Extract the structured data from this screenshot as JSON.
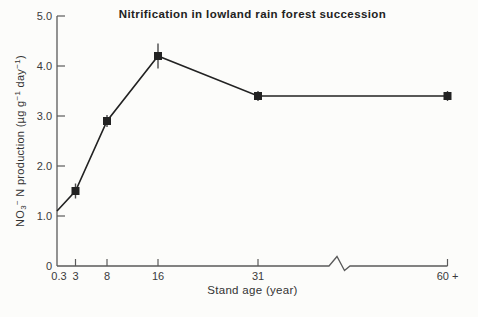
{
  "colors": {
    "background": "#fcfcfa",
    "ink": "#222222",
    "axis": "#5a5a5a",
    "error_bar": "#4a4a4a"
  },
  "chart_data": {
    "type": "line",
    "title": "Nitrification in lowland rain forest succession",
    "xlabel": "Stand age (year)",
    "ylabel": "NO3⁻ N production (µg g⁻¹ day⁻¹)",
    "ylabel_parts": [
      {
        "text": "NO"
      },
      {
        "text": "3",
        "style": "sub"
      },
      {
        "text": "−",
        "style": "sup"
      },
      {
        "text": " N production (µg g"
      },
      {
        "text": "−1",
        "style": "sup"
      },
      {
        "text": " day"
      },
      {
        "text": "−1",
        "style": "sup"
      },
      {
        "text": ")"
      }
    ],
    "ylim": [
      0,
      5
    ],
    "grid": false,
    "legend": "none",
    "y_ticks": [
      {
        "label": "0",
        "value": 0
      },
      {
        "label": "1.0",
        "value": 1
      },
      {
        "label": "2.0",
        "value": 2
      },
      {
        "label": "3.0",
        "value": 3
      },
      {
        "label": "4.0",
        "value": 4
      },
      {
        "label": "5.0",
        "value": 5
      }
    ],
    "x_tick_labels": [
      "0.3",
      "3",
      "8",
      "16",
      "31",
      "60 +"
    ],
    "x_axis_break": {
      "between": [
        "31",
        "60 +"
      ],
      "style": "zigzag"
    },
    "series": [
      {
        "name": "NO3-N production",
        "marker": "filled-square",
        "points": [
          {
            "x": "0.3",
            "value": 1.1,
            "error": null,
            "marker": false
          },
          {
            "x": "3",
            "value": 1.5,
            "error": 0.15,
            "marker": true
          },
          {
            "x": "8",
            "value": 2.9,
            "error": 0.12,
            "marker": true
          },
          {
            "x": "16",
            "value": 4.2,
            "error": 0.25,
            "marker": true
          },
          {
            "x": "31",
            "value": 3.4,
            "error": 0.1,
            "marker": true
          },
          {
            "x": "60 +",
            "value": 3.4,
            "error": 0.1,
            "marker": true
          }
        ]
      }
    ]
  }
}
